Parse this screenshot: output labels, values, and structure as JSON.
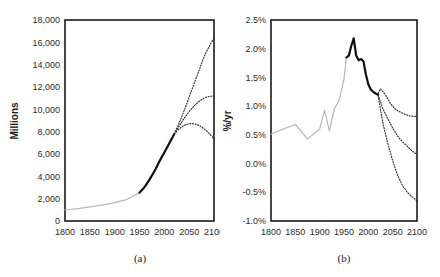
{
  "figure": {
    "background": "#ffffff",
    "width": 440,
    "height": 277
  },
  "panels": {
    "a": {
      "caption": "(a)",
      "ylabel": "Millions",
      "xlabel": "",
      "y_ticks": [
        "0",
        "2,000",
        "4,000",
        "6,000",
        "8,000",
        "10,000",
        "12,000",
        "14,000",
        "16,000",
        "18,000"
      ],
      "x_ticks": [
        "1800",
        "1850",
        "1900",
        "1950",
        "2000",
        "2050",
        "2100"
      ]
    },
    "b": {
      "caption": "(b)",
      "ylabel": "%/yr",
      "xlabel": "",
      "y_ticks": [
        "-1.0%",
        "-0.5%",
        "0.0%",
        "0.5%",
        "1.0%",
        "1.5%",
        "2.0%",
        "2.5%"
      ],
      "x_ticks": [
        "1800",
        "1850",
        "1900",
        "1950",
        "2000",
        "2050",
        "2100"
      ]
    }
  },
  "colors": {
    "historical": "#b9b9b9",
    "observed": "#111111",
    "projection": "#2a2a2a",
    "frame": "#1a1a1a",
    "text": "#1a1a1a"
  },
  "chart_data": [
    {
      "type": "line",
      "panel": "a",
      "title": "",
      "xlabel": "",
      "ylabel": "Millions",
      "xlim": [
        1800,
        2100
      ],
      "ylim": [
        0,
        18000
      ],
      "grid": false,
      "legend": "none",
      "x_ticks": [
        1800,
        1850,
        1900,
        1950,
        2000,
        2050,
        2100
      ],
      "y_ticks": [
        0,
        2000,
        4000,
        6000,
        8000,
        10000,
        12000,
        14000,
        16000,
        18000
      ],
      "series": [
        {
          "name": "World population, historical estimates",
          "style": "solid-grey",
          "color": "#b9b9b9",
          "x": [
            1800,
            1810,
            1820,
            1830,
            1840,
            1850,
            1860,
            1870,
            1880,
            1890,
            1900,
            1910,
            1920,
            1930,
            1940,
            1950
          ],
          "values": [
            990,
            1030,
            1080,
            1140,
            1200,
            1270,
            1340,
            1400,
            1470,
            1550,
            1650,
            1760,
            1870,
            2070,
            2300,
            2540
          ]
        },
        {
          "name": "World population, observed / estimated recent",
          "style": "solid-black",
          "color": "#111111",
          "x": [
            1950,
            1960,
            1970,
            1980,
            1990,
            2000,
            2010,
            2020
          ],
          "values": [
            2540,
            3030,
            3700,
            4450,
            5330,
            6140,
            6960,
            7800
          ]
        },
        {
          "name": "High projection",
          "style": "dotted",
          "color": "#2a2a2a",
          "x": [
            2020,
            2030,
            2040,
            2050,
            2060,
            2070,
            2080,
            2090,
            2100
          ],
          "values": [
            7800,
            8800,
            9900,
            11100,
            12300,
            13500,
            14700,
            15600,
            16400
          ]
        },
        {
          "name": "Medium projection",
          "style": "dotted",
          "color": "#2a2a2a",
          "x": [
            2020,
            2030,
            2040,
            2050,
            2060,
            2070,
            2080,
            2090,
            2100
          ],
          "values": [
            7800,
            8500,
            9200,
            9800,
            10300,
            10700,
            11000,
            11150,
            11200
          ]
        },
        {
          "name": "Low projection",
          "style": "dotted",
          "color": "#2a2a2a",
          "x": [
            2020,
            2030,
            2040,
            2050,
            2060,
            2070,
            2080,
            2090,
            2100
          ],
          "values": [
            7800,
            8250,
            8550,
            8700,
            8700,
            8550,
            8250,
            7850,
            7350
          ]
        }
      ]
    },
    {
      "type": "line",
      "panel": "b",
      "title": "",
      "xlabel": "",
      "ylabel": "%/yr",
      "xlim": [
        1800,
        2100
      ],
      "ylim": [
        -1.0,
        2.5
      ],
      "grid": false,
      "legend": "none",
      "x_ticks": [
        1800,
        1850,
        1900,
        1950,
        2000,
        2050,
        2100
      ],
      "y_ticks": [
        -1.0,
        -0.5,
        0.0,
        0.5,
        1.0,
        1.5,
        2.0,
        2.5
      ],
      "series": [
        {
          "name": "Growth rate, historical estimates",
          "style": "solid-grey",
          "color": "#b9b9b9",
          "x": [
            1800,
            1825,
            1850,
            1875,
            1900,
            1910,
            1920,
            1930,
            1940,
            1950,
            1955
          ],
          "values": [
            0.51,
            0.6,
            0.68,
            0.43,
            0.6,
            0.93,
            0.57,
            0.95,
            1.1,
            1.47,
            1.85
          ]
        },
        {
          "name": "Growth rate, observed",
          "style": "solid-black",
          "color": "#111111",
          "x": [
            1955,
            1960,
            1965,
            1970,
            1975,
            1980,
            1985,
            1990,
            1995,
            2000,
            2005,
            2010,
            2015,
            2020
          ],
          "values": [
            1.85,
            1.88,
            2.05,
            2.18,
            1.88,
            1.8,
            1.82,
            1.78,
            1.55,
            1.38,
            1.29,
            1.25,
            1.22,
            1.2
          ]
        },
        {
          "name": "High projection",
          "style": "dotted",
          "color": "#2a2a2a",
          "x": [
            2020,
            2025,
            2035,
            2045,
            2055,
            2065,
            2075,
            2085,
            2100
          ],
          "values": [
            1.22,
            1.3,
            1.2,
            1.05,
            0.95,
            0.9,
            0.86,
            0.83,
            0.82
          ]
        },
        {
          "name": "Medium projection",
          "style": "dotted",
          "color": "#2a2a2a",
          "x": [
            2020,
            2030,
            2040,
            2050,
            2060,
            2070,
            2080,
            2090,
            2100
          ],
          "values": [
            1.2,
            0.95,
            0.78,
            0.62,
            0.48,
            0.38,
            0.3,
            0.22,
            0.16
          ]
        },
        {
          "name": "Low projection",
          "style": "dotted",
          "color": "#2a2a2a",
          "x": [
            2020,
            2030,
            2040,
            2050,
            2060,
            2070,
            2080,
            2090,
            2100
          ],
          "values": [
            1.18,
            0.7,
            0.35,
            0.05,
            -0.2,
            -0.38,
            -0.5,
            -0.58,
            -0.65
          ]
        }
      ]
    }
  ]
}
